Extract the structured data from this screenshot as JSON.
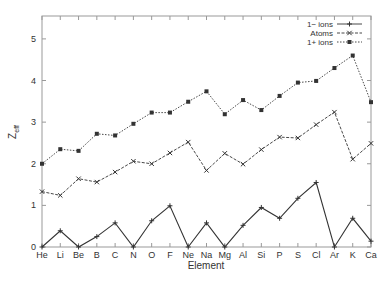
{
  "chart_data": {
    "type": "line",
    "title": "",
    "xlabel": "Element",
    "ylabel": "Z_eff",
    "ylabel_main": "Z",
    "ylabel_sub": "eff",
    "categories": [
      "He",
      "Li",
      "Be",
      "B",
      "C",
      "N",
      "O",
      "F",
      "Ne",
      "Na",
      "Mg",
      "Al",
      "Si",
      "P",
      "S",
      "Cl",
      "Ar",
      "K",
      "Ca"
    ],
    "yticks": [
      0,
      1,
      2,
      3,
      4,
      5
    ],
    "ylim": [
      0,
      5.55
    ],
    "grid": false,
    "legend_position": "top-right",
    "series": [
      {
        "name": "1− ions",
        "style": "solid",
        "marker": "plus",
        "values": [
          0,
          0.39,
          0,
          0.25,
          0.58,
          0,
          0.63,
          0.99,
          0,
          0.58,
          0,
          0.52,
          0.95,
          0.69,
          1.17,
          1.55,
          0,
          0.69,
          0.14
        ]
      },
      {
        "name": "Atoms",
        "style": "dashed",
        "marker": "cross",
        "values": [
          1.33,
          1.24,
          1.64,
          1.56,
          1.8,
          2.06,
          2.0,
          2.26,
          2.52,
          1.84,
          2.25,
          1.99,
          2.34,
          2.64,
          2.62,
          2.94,
          3.24,
          2.11,
          2.49
        ]
      },
      {
        "name": "1+ ions",
        "style": "dotted",
        "marker": "square",
        "values": [
          2.0,
          2.35,
          2.31,
          2.72,
          2.68,
          2.96,
          3.23,
          3.23,
          3.49,
          3.74,
          3.19,
          3.53,
          3.29,
          3.63,
          3.95,
          3.99,
          4.3,
          4.6,
          3.48
        ]
      }
    ]
  }
}
